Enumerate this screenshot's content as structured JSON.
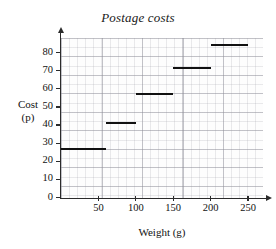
{
  "chart_data": {
    "type": "line",
    "subtype": "step",
    "title": "Postage costs",
    "xlabel": "Weight (g)",
    "ylabel": "Cost\n(p)",
    "ylabel_lines": [
      "Cost",
      "(p)"
    ],
    "xlim": [
      0,
      270
    ],
    "ylim": [
      0,
      88
    ],
    "grid": true,
    "legend": null,
    "xticks": [
      50,
      100,
      150,
      200,
      250
    ],
    "xtick_labels": [
      "50",
      "100",
      "150",
      "200",
      "250"
    ],
    "yticks": [
      0,
      10,
      20,
      30,
      40,
      50,
      60,
      70,
      80
    ],
    "ytick_labels": [
      "0",
      "10",
      "20",
      "30",
      "40",
      "50",
      "60",
      "70",
      "80"
    ],
    "series": [
      {
        "name": "Postage cost",
        "steps": [
          {
            "x_start": 0,
            "x_end": 60,
            "value": 27
          },
          {
            "x_start": 60,
            "x_end": 100,
            "value": 41
          },
          {
            "x_start": 100,
            "x_end": 150,
            "value": 57
          },
          {
            "x_start": 150,
            "x_end": 200,
            "value": 71.5
          },
          {
            "x_start": 200,
            "x_end": 250,
            "value": 84
          }
        ]
      }
    ],
    "colors": {
      "line": "#111111",
      "grid": "#8c8c96",
      "axis": "#2b2b2b"
    }
  }
}
